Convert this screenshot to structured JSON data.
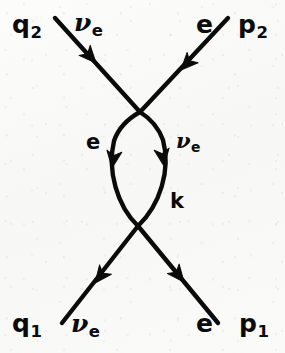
{
  "figure": {
    "kind": "feynman-diagram",
    "ink_color": "#0b0b0b",
    "background_color": "#fbfbfa",
    "width": 285,
    "height": 353
  },
  "labels": {
    "incoming_neutrino_momentum": "q",
    "incoming_neutrino_momentum_sub": "1",
    "incoming_neutrino_particle_sym": "ν",
    "incoming_neutrino_particle_sub": "e",
    "incoming_electron_momentum": "p",
    "incoming_electron_momentum_sub": "1",
    "incoming_electron_particle": "e",
    "outgoing_neutrino_momentum": "q",
    "outgoing_neutrino_momentum_sub": "2",
    "outgoing_neutrino_particle_sym": "ν",
    "outgoing_neutrino_particle_sub": "e",
    "outgoing_electron_momentum": "p",
    "outgoing_electron_momentum_sub": "2",
    "outgoing_electron_particle": "e",
    "internal_electron_particle": "e",
    "internal_neutrino_particle_sym": "ν",
    "internal_neutrino_particle_sub": "e",
    "internal_momentum": "k"
  },
  "lines": [
    {
      "name": "neutrino-line",
      "from": "q1 (bottom-left, incoming)",
      "to": "q2 (top-left, outgoing)",
      "arrow_direction": "upward",
      "arrowheads": 3
    },
    {
      "name": "electron-line",
      "from": "p1 (bottom-right, incoming)",
      "to": "p2 (top-right, outgoing)",
      "arrow_direction": "upward",
      "arrowheads": 3
    }
  ],
  "vertices": [
    {
      "name": "upper-vertex",
      "x": 140,
      "y": 112
    },
    {
      "name": "lower-vertex",
      "x": 138,
      "y": 226
    }
  ]
}
